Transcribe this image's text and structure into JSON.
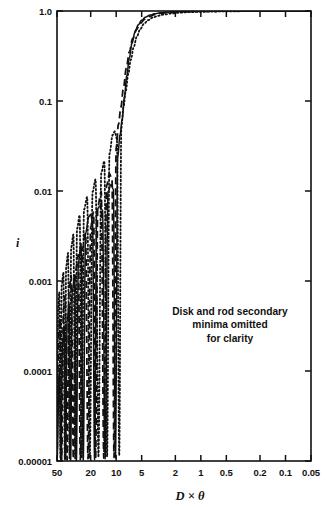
{
  "figure": {
    "width": 330,
    "height": 507,
    "background": "#ffffff",
    "ink_color": "#111111"
  },
  "axes": {
    "left": 57,
    "right": 311,
    "top": 11,
    "bottom": 461
  },
  "annotation": {
    "line1": "Disk and rod secondary",
    "line2": "minima omitted",
    "line3": "for clarity"
  },
  "chart_data": {
    "type": "line",
    "title": "",
    "subtitle": "",
    "xlabel": "D × θ",
    "ylabel": "i",
    "xscale": "log",
    "yscale": "log",
    "x_reversed": true,
    "xlim": [
      50,
      0.05
    ],
    "ylim": [
      1e-05,
      1.0
    ],
    "grid": false,
    "legend": "none",
    "xticks": [
      50,
      20,
      10,
      5,
      2,
      1,
      0.5,
      0.2,
      0.1,
      0.05
    ],
    "xtick_labels": [
      "50",
      "20",
      "10",
      "5",
      "2",
      "1",
      "0.5",
      "0.2",
      "0.1",
      "0.05"
    ],
    "yticks": [
      1.0,
      0.1,
      0.01,
      0.001,
      0.0001,
      1e-05
    ],
    "ytick_labels": [
      "1.0",
      "0.1",
      "0.01",
      "0.001",
      "0.0001",
      "0.00001"
    ],
    "annotations": [
      {
        "text": "Disk and rod secondary minima omitted for clarity",
        "x": 1.0,
        "y": 0.0012
      }
    ],
    "series": [
      {
        "name": "sphere",
        "style": "solid",
        "color": "#111111",
        "points": [
          [
            50,
            1.02e-05
          ],
          [
            47,
            9.8e-05
          ],
          [
            45,
            9.8e-06
          ],
          [
            43,
            0.00021
          ],
          [
            41,
            0.00031
          ],
          [
            39.5,
            1.05e-05
          ],
          [
            38,
            0.00036
          ],
          [
            36,
            0.00055
          ],
          [
            34.5,
            1.02e-05
          ],
          [
            33,
            0.00078
          ],
          [
            31,
            0.00115
          ],
          [
            29.5,
            1.01e-05
          ],
          [
            28,
            0.0016
          ],
          [
            26,
            0.0026
          ],
          [
            24.5,
            1.03e-05
          ],
          [
            23,
            0.0034
          ],
          [
            21,
            0.0052
          ],
          [
            20,
            0.0055
          ],
          [
            19,
            0.0044
          ],
          [
            18,
            1.04e-05
          ],
          [
            17,
            0.0062
          ],
          [
            15.5,
            0.0068
          ],
          [
            14.5,
            0.0061
          ],
          [
            13.5,
            1.06e-05
          ],
          [
            12.5,
            0.0098
          ],
          [
            11.5,
            0.0118
          ],
          [
            10.8,
            0.0105
          ],
          [
            10.2,
            1.08e-05
          ],
          [
            9.6,
            0.024
          ],
          [
            9.0,
            0.042
          ],
          [
            8.5,
            0.062
          ],
          [
            8.0,
            0.11
          ],
          [
            7.5,
            0.19
          ],
          [
            7.0,
            0.3
          ],
          [
            6.5,
            0.44
          ],
          [
            6.0,
            0.58
          ],
          [
            5.5,
            0.7
          ],
          [
            5.0,
            0.79
          ],
          [
            4.5,
            0.855
          ],
          [
            4.0,
            0.9
          ],
          [
            3.5,
            0.932
          ],
          [
            3.0,
            0.955
          ],
          [
            2.5,
            0.97
          ],
          [
            2.0,
            0.98
          ],
          [
            1.5,
            0.988
          ],
          [
            1.0,
            0.993
          ],
          [
            0.7,
            0.996
          ],
          [
            0.5,
            0.997
          ],
          [
            0.3,
            0.998
          ],
          [
            0.2,
            0.999
          ],
          [
            0.1,
            0.9995
          ],
          [
            0.05,
            1.0
          ]
        ]
      },
      {
        "name": "rod",
        "style": "dashed",
        "color": "#111111",
        "points": [
          [
            50,
            1.03e-05
          ],
          [
            48,
            0.00026
          ],
          [
            46,
            0.00038
          ],
          [
            44,
            1.04e-05
          ],
          [
            42,
            0.00048
          ],
          [
            40,
            0.00068
          ],
          [
            38,
            1.03e-05
          ],
          [
            36,
            0.00082
          ],
          [
            34,
            0.00115
          ],
          [
            32,
            1.05e-05
          ],
          [
            30,
            0.00135
          ],
          [
            28,
            0.00195
          ],
          [
            26.5,
            1.04e-05
          ],
          [
            25,
            0.0023
          ],
          [
            23,
            0.0034
          ],
          [
            21.5,
            1.06e-05
          ],
          [
            20,
            0.004
          ],
          [
            18.5,
            0.0058
          ],
          [
            17.5,
            1.07e-05
          ],
          [
            16.5,
            0.0068
          ],
          [
            15,
            0.0098
          ],
          [
            14,
            1.08e-05
          ],
          [
            13,
            0.0115
          ],
          [
            12,
            0.0155
          ],
          [
            11.2,
            0.0135
          ],
          [
            10.6,
            1.1e-05
          ],
          [
            10.0,
            0.03
          ],
          [
            9.4,
            0.055
          ],
          [
            8.8,
            0.085
          ],
          [
            8.2,
            0.14
          ],
          [
            7.6,
            0.23
          ],
          [
            7.0,
            0.35
          ],
          [
            6.4,
            0.49
          ],
          [
            5.8,
            0.62
          ],
          [
            5.2,
            0.73
          ],
          [
            4.6,
            0.81
          ],
          [
            4.0,
            0.872
          ],
          [
            3.5,
            0.912
          ],
          [
            3.0,
            0.94
          ],
          [
            2.5,
            0.96
          ],
          [
            2.0,
            0.974
          ],
          [
            1.5,
            0.984
          ],
          [
            1.0,
            0.991
          ],
          [
            0.7,
            0.994
          ],
          [
            0.5,
            0.996
          ],
          [
            0.3,
            0.998
          ],
          [
            0.2,
            0.999
          ],
          [
            0.1,
            0.9995
          ],
          [
            0.05,
            1.0
          ]
        ]
      },
      {
        "name": "disk",
        "style": "dotted",
        "color": "#111111",
        "points": [
          [
            50,
            1.05e-05
          ],
          [
            48.5,
            0.00052
          ],
          [
            47,
            0.00075
          ],
          [
            45.5,
            1.06e-05
          ],
          [
            44,
            0.0009
          ],
          [
            42,
            0.00125
          ],
          [
            40.5,
            1.05e-05
          ],
          [
            39,
            0.00145
          ],
          [
            37,
            0.00205
          ],
          [
            35.5,
            1.07e-05
          ],
          [
            34,
            0.00235
          ],
          [
            32,
            0.0033
          ],
          [
            30.5,
            1.06e-05
          ],
          [
            29,
            0.0038
          ],
          [
            27,
            0.0054
          ],
          [
            25.5,
            1.08e-05
          ],
          [
            24,
            0.0062
          ],
          [
            22,
            0.0086
          ],
          [
            20.5,
            1.09e-05
          ],
          [
            19,
            0.0098
          ],
          [
            17.5,
            0.0135
          ],
          [
            16.2,
            1.1e-05
          ],
          [
            15,
            0.016
          ],
          [
            13.8,
            0.0215
          ],
          [
            12.8,
            1.12e-05
          ],
          [
            12,
            0.026
          ],
          [
            11,
            0.042
          ],
          [
            10.4,
            0.046
          ],
          [
            9.8,
            0.038
          ],
          [
            9.2,
            1.15e-05
          ],
          [
            8.7,
            0.05
          ],
          [
            8.2,
            0.085
          ],
          [
            7.7,
            0.13
          ],
          [
            7.2,
            0.2
          ],
          [
            6.7,
            0.29
          ],
          [
            6.2,
            0.4
          ],
          [
            5.7,
            0.52
          ],
          [
            5.2,
            0.63
          ],
          [
            4.7,
            0.72
          ],
          [
            4.2,
            0.79
          ],
          [
            3.7,
            0.845
          ],
          [
            3.2,
            0.885
          ],
          [
            2.7,
            0.915
          ],
          [
            2.2,
            0.94
          ],
          [
            1.8,
            0.957
          ],
          [
            1.4,
            0.97
          ],
          [
            1.0,
            0.98
          ],
          [
            0.7,
            0.987
          ],
          [
            0.5,
            0.991
          ],
          [
            0.3,
            0.995
          ],
          [
            0.2,
            0.997
          ],
          [
            0.1,
            0.999
          ],
          [
            0.05,
            1.0
          ]
        ]
      }
    ]
  }
}
